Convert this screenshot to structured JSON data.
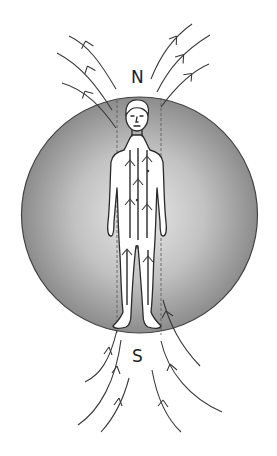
{
  "diagram": {
    "labels": {
      "north": "N",
      "south": "S"
    },
    "colors": {
      "sphere_center": "#e6e6e6",
      "sphere_edge": "#8f8f8f",
      "sphere_outline": "#444444",
      "line": "#3a3a3a",
      "figure_fill": "#ffffff"
    },
    "field_lines": {
      "top_left_count": 3,
      "top_right_count": 3,
      "bottom_left_count": 3,
      "bottom_right_count": 3,
      "internal_count": 5,
      "direction": "south-to-north"
    }
  }
}
